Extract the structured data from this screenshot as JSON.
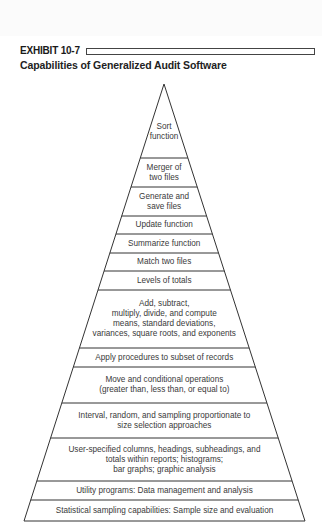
{
  "exhibit": {
    "label": "EXHIBIT 10-7",
    "title": "Capabilities of Generalized Audit Software"
  },
  "pyramid": {
    "apex": [
      164,
      84
    ],
    "base_left": [
      24,
      521
    ],
    "base_right": [
      305,
      521
    ],
    "line_color": "#333333",
    "layers": [
      {
        "lines": [
          "Sort",
          "function"
        ],
        "y_top": 84,
        "y_bottom": 158
      },
      {
        "lines": [
          "Merger of",
          "two files"
        ],
        "y_top": 158,
        "y_bottom": 187
      },
      {
        "lines": [
          "Generate and",
          "save files"
        ],
        "y_top": 187,
        "y_bottom": 216
      },
      {
        "lines": [
          "Update function"
        ],
        "y_top": 216,
        "y_bottom": 234
      },
      {
        "lines": [
          "Summarize function"
        ],
        "y_top": 234,
        "y_bottom": 253
      },
      {
        "lines": [
          "Match two files"
        ],
        "y_top": 253,
        "y_bottom": 271
      },
      {
        "lines": [
          "Levels of totals"
        ],
        "y_top": 271,
        "y_bottom": 290
      },
      {
        "lines": [
          "Add, subtract,",
          "multiply, divide, and compute",
          "means, standard deviations,",
          "variances, square roots, and exponents"
        ],
        "y_top": 290,
        "y_bottom": 348
      },
      {
        "lines": [
          "Apply procedures to subset of records"
        ],
        "y_top": 348,
        "y_bottom": 367
      },
      {
        "lines": [
          "Move and conditional operations",
          "(greater than, less than, or equal to)"
        ],
        "y_top": 367,
        "y_bottom": 403
      },
      {
        "lines": [
          "Interval, random, and sampling proportionate to",
          "size selection approaches"
        ],
        "y_top": 403,
        "y_bottom": 438
      },
      {
        "lines": [
          "User-specified columns, headings, subheadings, and",
          "totals within reports; histograms;",
          "bar graphs; graphic analysis"
        ],
        "y_top": 438,
        "y_bottom": 481
      },
      {
        "lines": [
          "Utility programs:  Data management and analysis"
        ],
        "y_top": 481,
        "y_bottom": 500
      },
      {
        "lines": [
          "Statistical sampling capabilities:  Sample size and evaluation"
        ],
        "y_top": 500,
        "y_bottom": 521
      }
    ]
  }
}
